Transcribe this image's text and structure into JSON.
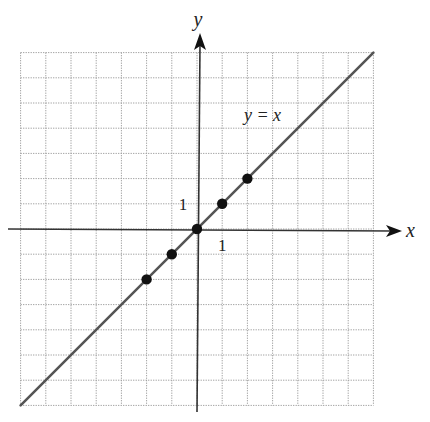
{
  "chart_data": {
    "type": "line",
    "title": "",
    "xlabel": "x",
    "ylabel": "y",
    "xlim": [
      -7,
      7
    ],
    "ylim": [
      -7,
      7
    ],
    "grid": true,
    "grid_style": "dotted",
    "legend": null,
    "tick_labels": {
      "x": [
        {
          "value": 1,
          "label": "1"
        }
      ],
      "y": [
        {
          "value": 1,
          "label": "1"
        }
      ]
    },
    "series": [
      {
        "name": "y = x",
        "kind": "line",
        "x": [
          -7,
          7
        ],
        "y": [
          -7,
          7
        ]
      },
      {
        "name": "points",
        "kind": "scatter",
        "x": [
          -2,
          -1,
          0,
          1,
          2
        ],
        "y": [
          -2,
          -1,
          0,
          1,
          2
        ]
      }
    ],
    "annotations": [
      {
        "text": "y = x",
        "x": 2.6,
        "y": 4.3
      }
    ]
  },
  "labels": {
    "x_axis": "x",
    "y_axis": "y",
    "x_tick_one": "1",
    "y_tick_one": "1",
    "line_label": "y = x"
  },
  "colors": {
    "grid": "#9a9a9a",
    "axis": "#333333",
    "line": "#555555",
    "point": "#111111"
  }
}
